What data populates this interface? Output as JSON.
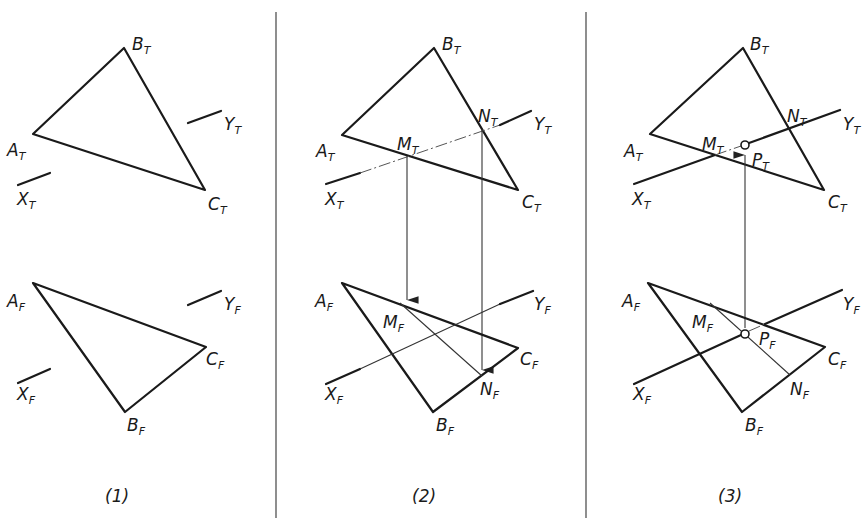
{
  "figure": {
    "panels": [
      {
        "caption": "(1)",
        "top_view": {
          "A": "A",
          "B": "B",
          "C": "C",
          "X": "X",
          "Y": "Y",
          "sub": "T"
        },
        "front_view": {
          "A": "A",
          "B": "B",
          "C": "C",
          "X": "X",
          "Y": "Y",
          "sub": "F"
        }
      },
      {
        "caption": "(2)",
        "top_view": {
          "A": "A",
          "B": "B",
          "C": "C",
          "X": "X",
          "Y": "Y",
          "M": "M",
          "N": "N",
          "sub": "T"
        },
        "front_view": {
          "A": "A",
          "B": "B",
          "C": "C",
          "X": "X",
          "Y": "Y",
          "M": "M",
          "N": "N",
          "sub": "F"
        }
      },
      {
        "caption": "(3)",
        "top_view": {
          "A": "A",
          "B": "B",
          "C": "C",
          "X": "X",
          "Y": "Y",
          "M": "M",
          "N": "N",
          "P": "P",
          "sub": "T"
        },
        "front_view": {
          "A": "A",
          "B": "B",
          "C": "C",
          "X": "X",
          "Y": "Y",
          "M": "M",
          "N": "N",
          "P": "P",
          "sub": "F"
        }
      }
    ]
  }
}
